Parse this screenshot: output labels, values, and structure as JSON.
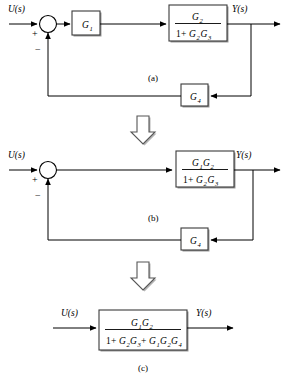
{
  "figure": {
    "signals": {
      "input": "U(s)",
      "output": "Y(s)"
    },
    "signs": {
      "positive": "+",
      "negative": "−"
    },
    "colors": {
      "line": "#000000",
      "block_border": "#3a3a3a",
      "block_fill": "#ffffff",
      "shadow": "#9a9a9a",
      "background": "#ffffff"
    },
    "stages": [
      {
        "id": "a",
        "caption": "(a)",
        "input_label": "U(s)",
        "output_label": "Y(s)",
        "summing_junction": {
          "name": "summing-junction",
          "plus_sign": "+",
          "minus_sign": "−"
        },
        "forward_blocks": [
          {
            "name": "block-g1",
            "kind": "simple",
            "text": "G",
            "subscript": "1"
          },
          {
            "name": "block-g2-over-1-plus-g2g3",
            "kind": "fraction",
            "numerator": [
              {
                "base": "G",
                "sub": "2"
              }
            ],
            "denominator": [
              {
                "base": "1",
                "sub": ""
              },
              {
                "op": "+"
              },
              {
                "base": "G",
                "sub": "2"
              },
              {
                "base": "G",
                "sub": "3"
              }
            ],
            "numerator_text": "G2",
            "denominator_text": "1+G2G3"
          }
        ],
        "feedback_blocks": [
          {
            "name": "block-g4",
            "kind": "simple",
            "text": "G",
            "subscript": "4"
          }
        ]
      },
      {
        "id": "b",
        "caption": "(b)",
        "input_label": "U(s)",
        "output_label": "Y(s)",
        "summing_junction": {
          "name": "summing-junction",
          "plus_sign": "+",
          "minus_sign": "−"
        },
        "forward_blocks": [
          {
            "name": "block-g1g2-over-1-plus-g2g3",
            "kind": "fraction",
            "numerator": [
              {
                "base": "G",
                "sub": "1"
              },
              {
                "base": "G",
                "sub": "2"
              }
            ],
            "denominator": [
              {
                "base": "1",
                "sub": ""
              },
              {
                "op": "+"
              },
              {
                "base": "G",
                "sub": "2"
              },
              {
                "base": "G",
                "sub": "3"
              }
            ],
            "numerator_text": "G1G2",
            "denominator_text": "1+G2G3"
          }
        ],
        "feedback_blocks": [
          {
            "name": "block-g4",
            "kind": "simple",
            "text": "G",
            "subscript": "4"
          }
        ]
      },
      {
        "id": "c",
        "caption": "(c)",
        "input_label": "U(s)",
        "output_label": "Y(s)",
        "summing_junction": null,
        "forward_blocks": [
          {
            "name": "block-closed-loop-transfer-function",
            "kind": "fraction",
            "numerator": [
              {
                "base": "G",
                "sub": "1"
              },
              {
                "base": "G",
                "sub": "2"
              }
            ],
            "denominator": [
              {
                "base": "1",
                "sub": ""
              },
              {
                "op": "+"
              },
              {
                "base": "G",
                "sub": "2"
              },
              {
                "base": "G",
                "sub": "3"
              },
              {
                "op": "+"
              },
              {
                "base": "G",
                "sub": "1"
              },
              {
                "base": "G",
                "sub": "2"
              },
              {
                "base": "G",
                "sub": "4"
              }
            ],
            "numerator_text": "G1G2",
            "denominator_text": "1+G2G3+G1G2G4"
          }
        ],
        "feedback_blocks": []
      }
    ],
    "transition_arrows": [
      {
        "name": "down-arrow-a-to-b",
        "direction": "down"
      },
      {
        "name": "down-arrow-b-to-c",
        "direction": "down"
      }
    ]
  }
}
